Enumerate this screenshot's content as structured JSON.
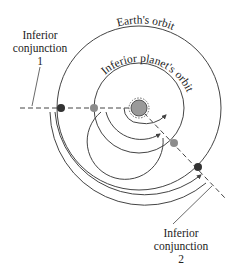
{
  "diagram": {
    "orbit_labels": {
      "earth": "Earth's orbit",
      "inferior": "Inferior planet's orbit"
    },
    "conjunction_1": {
      "line1": "Inferior",
      "line2": "conjunction",
      "number": "1"
    },
    "conjunction_2": {
      "line1": "Inferior",
      "line2": "conjunction",
      "number": "2"
    },
    "colors": {
      "orbit": "#444444",
      "sun_fill": "#9a9a9a",
      "earth_dot": "#333333",
      "planet_dot": "#8c8c8c",
      "text": "#222222"
    }
  }
}
